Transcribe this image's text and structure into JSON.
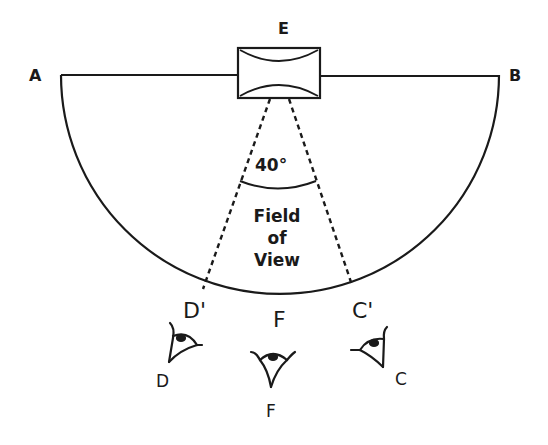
{
  "diagram": {
    "points": {
      "A": "A",
      "B": "B",
      "E": "E",
      "D_prime": "D'",
      "C_prime": "C'",
      "F_upper": "F",
      "D": "D",
      "C": "C",
      "F_lower": "F"
    },
    "angle_label": "40°",
    "field_of_view": [
      "Field",
      "of",
      "View"
    ],
    "colors": {
      "stroke": "#1a1a1a",
      "background": "#ffffff"
    }
  }
}
